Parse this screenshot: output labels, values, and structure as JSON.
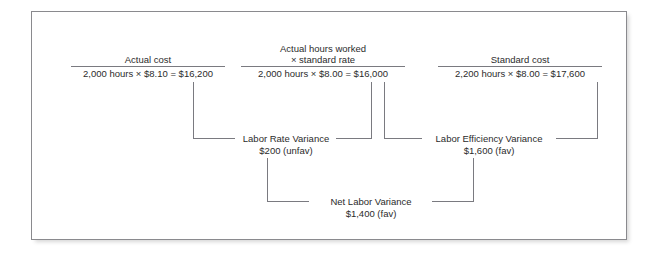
{
  "diagram": {
    "line_color": "#7a7a80",
    "text_color": "#2b2b2b",
    "border_color": "#8a8a8e",
    "background": "#ffffff",
    "columns": [
      {
        "id": "actual-cost",
        "numerator": "Actual cost",
        "numerator_line2": "",
        "denominator": "2,000 hours × $8.10 = $16,200",
        "hours": "2,000",
        "rate": "$8.10",
        "total": "$16,200"
      },
      {
        "id": "actual-hours-at-standard-rate",
        "numerator": "Actual hours worked",
        "numerator_line2": "× standard rate",
        "denominator": "2,000 hours × $8.00 = $16,000",
        "hours": "2,000",
        "rate": "$8.00",
        "total": "$16,000"
      },
      {
        "id": "standard-cost",
        "numerator": "Standard cost",
        "numerator_line2": "",
        "denominator": "2,200 hours × $8.00 = $17,600",
        "hours": "2,200",
        "rate": "$8.00",
        "total": "$17,600"
      }
    ],
    "variances": [
      {
        "id": "labor-rate-variance",
        "title": "Labor Rate Variance",
        "amount": "$200 (unfav)",
        "value": 200,
        "direction": "unfav"
      },
      {
        "id": "labor-efficiency-variance",
        "title": "Labor Efficiency Variance",
        "amount": "$1,600 (fav)",
        "value": 1600,
        "direction": "fav"
      },
      {
        "id": "net-labor-variance",
        "title": "Net Labor Variance",
        "amount": "$1,400 (fav)",
        "value": 1400,
        "direction": "fav"
      }
    ]
  }
}
